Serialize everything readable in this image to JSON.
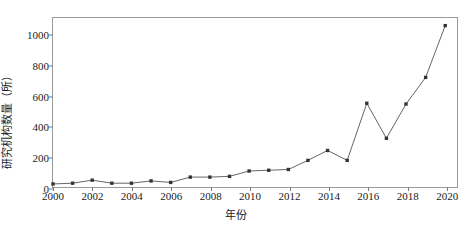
{
  "chart_data": {
    "type": "line",
    "title": "",
    "xlabel": "年份",
    "ylabel": "研究机构数量（所）",
    "x": [
      2000,
      2001,
      2002,
      2003,
      2004,
      2005,
      2006,
      2007,
      2008,
      2009,
      2010,
      2011,
      2012,
      2013,
      2014,
      2015,
      2016,
      2017,
      2018,
      2019,
      2020
    ],
    "values": [
      20,
      25,
      45,
      25,
      25,
      40,
      30,
      65,
      65,
      70,
      105,
      110,
      115,
      175,
      240,
      175,
      550,
      320,
      545,
      720,
      1060
    ],
    "series": [
      {
        "name": "研究机构数量",
        "values": [
          20,
          25,
          45,
          25,
          25,
          40,
          30,
          65,
          65,
          70,
          105,
          110,
          115,
          175,
          240,
          175,
          550,
          320,
          545,
          720,
          1060
        ]
      }
    ],
    "xlim": [
      2000,
      2020.6
    ],
    "ylim": [
      0,
      1110
    ],
    "ytick_labels": [
      "0",
      "200",
      "400",
      "600",
      "800",
      "1000"
    ],
    "ytick_values": [
      0,
      200,
      400,
      600,
      800,
      1000
    ],
    "xtick_labels": [
      "2000",
      "2002",
      "2004",
      "2006",
      "2008",
      "2010",
      "2012",
      "2014",
      "2016",
      "2018",
      "2020"
    ],
    "xtick_values": [
      2000,
      2002,
      2004,
      2006,
      2008,
      2010,
      2012,
      2014,
      2016,
      2018,
      2020
    ],
    "grid": false,
    "legend": "none",
    "line_color": "#555555",
    "marker_color": "#333333",
    "marker": "square"
  }
}
